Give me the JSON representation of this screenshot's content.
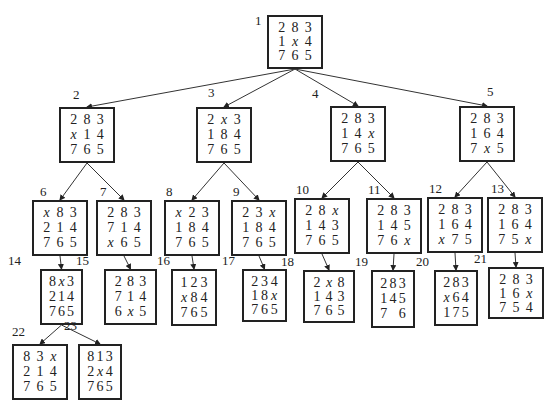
{
  "diagram": {
    "type": "search-tree",
    "blank_symbol": "x",
    "nodes": [
      {
        "id": "1",
        "cells": [
          "2",
          "8",
          "3",
          "1",
          "x",
          "4",
          "7",
          "6",
          "5"
        ]
      },
      {
        "id": "2",
        "cells": [
          "2",
          "8",
          "3",
          "x",
          "1",
          "4",
          "7",
          "6",
          "5"
        ]
      },
      {
        "id": "3",
        "cells": [
          "2",
          "x",
          "3",
          "1",
          "8",
          "4",
          "7",
          "6",
          "5"
        ]
      },
      {
        "id": "4",
        "cells": [
          "2",
          "8",
          "3",
          "1",
          "4",
          "x",
          "7",
          "6",
          "5"
        ]
      },
      {
        "id": "5",
        "cells": [
          "2",
          "8",
          "3",
          "1",
          "6",
          "4",
          "7",
          "x",
          "5"
        ]
      },
      {
        "id": "6",
        "cells": [
          "x",
          "8",
          "3",
          "2",
          "1",
          "4",
          "7",
          "6",
          "5"
        ]
      },
      {
        "id": "7",
        "cells": [
          "2",
          "8",
          "3",
          "7",
          "1",
          "4",
          "x",
          "6",
          "5"
        ]
      },
      {
        "id": "8",
        "cells": [
          "x",
          "2",
          "3",
          "1",
          "8",
          "4",
          "7",
          "6",
          "5"
        ]
      },
      {
        "id": "9",
        "cells": [
          "2",
          "3",
          "x",
          "1",
          "8",
          "4",
          "7",
          "6",
          "5"
        ]
      },
      {
        "id": "10",
        "cells": [
          "2",
          "8",
          "x",
          "1",
          "4",
          "3",
          "7",
          "6",
          "5"
        ]
      },
      {
        "id": "11",
        "cells": [
          "2",
          "8",
          "3",
          "1",
          "4",
          "5",
          "7",
          "6",
          "x"
        ]
      },
      {
        "id": "12",
        "cells": [
          "2",
          "8",
          "3",
          "1",
          "6",
          "4",
          "x",
          "7",
          "5"
        ]
      },
      {
        "id": "13",
        "cells": [
          "2",
          "8",
          "3",
          "1",
          "6",
          "4",
          "7",
          "5",
          "x"
        ]
      },
      {
        "id": "14",
        "cells": [
          "8",
          "x",
          "3",
          "2",
          "1",
          "4",
          "7",
          "6",
          "5"
        ]
      },
      {
        "id": "15",
        "cells": [
          "2",
          "8",
          "3",
          "7",
          "1",
          "4",
          "6",
          "x",
          "5"
        ]
      },
      {
        "id": "16",
        "cells": [
          "1",
          "2",
          "3",
          "x",
          "8",
          "4",
          "7",
          "6",
          "5"
        ]
      },
      {
        "id": "17",
        "cells": [
          "2",
          "3",
          "4",
          "1",
          "8",
          "x",
          "7",
          "6",
          "5"
        ]
      },
      {
        "id": "18",
        "cells": [
          "2",
          "x",
          "8",
          "1",
          "4",
          "3",
          "7",
          "6",
          "5"
        ]
      },
      {
        "id": "19",
        "cells": [
          "2",
          "8",
          "3",
          "1",
          "4",
          "5",
          "7",
          "",
          "6"
        ]
      },
      {
        "id": "20",
        "cells": [
          "2",
          "8",
          "3",
          "x",
          "6",
          "4",
          "1",
          "7",
          "5"
        ]
      },
      {
        "id": "21",
        "cells": [
          "2",
          "8",
          "3",
          "1",
          "6",
          "x",
          "7",
          "5",
          "4"
        ]
      },
      {
        "id": "22",
        "cells": [
          "8",
          "3",
          "x",
          "2",
          "1",
          "4",
          "7",
          "6",
          "5"
        ]
      },
      {
        "id": "23",
        "cells": [
          "8",
          "1",
          "3",
          "2",
          "x",
          "4",
          "7",
          "6",
          "5"
        ]
      }
    ],
    "edges": [
      [
        "1",
        "2"
      ],
      [
        "1",
        "3"
      ],
      [
        "1",
        "4"
      ],
      [
        "1",
        "5"
      ],
      [
        "2",
        "6"
      ],
      [
        "2",
        "7"
      ],
      [
        "3",
        "8"
      ],
      [
        "3",
        "9"
      ],
      [
        "4",
        "10"
      ],
      [
        "4",
        "11"
      ],
      [
        "5",
        "12"
      ],
      [
        "5",
        "13"
      ],
      [
        "6",
        "14"
      ],
      [
        "7",
        "15"
      ],
      [
        "8",
        "16"
      ],
      [
        "9",
        "17"
      ],
      [
        "10",
        "18"
      ],
      [
        "11",
        "19"
      ],
      [
        "12",
        "20"
      ],
      [
        "13",
        "21"
      ],
      [
        "14",
        "22"
      ],
      [
        "14",
        "23"
      ]
    ]
  }
}
